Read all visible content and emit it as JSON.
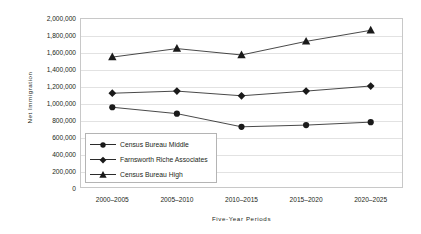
{
  "chart_data": {
    "type": "line",
    "title": "",
    "subtitle": "",
    "xlabel": "Five-Year Periods",
    "ylabel": "Net Immigration",
    "categories": [
      "2000–2005",
      "2005–2010",
      "2010–2015",
      "2015–2020",
      "2020–2025"
    ],
    "ylim": [
      0,
      2000000
    ],
    "ytick_step": 200000,
    "ytick_labels": [
      "2,000,000",
      "1,800,000",
      "1,600,000",
      "1,400,000",
      "1,200,000",
      "1,000,000",
      "800,000",
      "600,000",
      "400,000",
      "200,000",
      "0"
    ],
    "ytick_values": [
      2000000,
      1800000,
      1600000,
      1400000,
      1200000,
      1000000,
      800000,
      600000,
      400000,
      200000,
      0
    ],
    "grid": true,
    "grid_axis": "y",
    "legend_position": "inside-lower-left",
    "series": [
      {
        "name": "Census Bureau Middle",
        "marker": "circle",
        "color": "#1a1a1a",
        "values": [
          950000,
          875000,
          720000,
          740000,
          775000
        ]
      },
      {
        "name": "Farnsworth Riche Associates",
        "marker": "diamond",
        "color": "#1a1a1a",
        "values": [
          1115000,
          1140000,
          1085000,
          1140000,
          1200000
        ]
      },
      {
        "name": "Census Bureau High",
        "marker": "triangle",
        "color": "#1a1a1a",
        "values": [
          1540000,
          1640000,
          1565000,
          1725000,
          1855000
        ]
      }
    ]
  },
  "legend": {
    "items": [
      {
        "label": "Census Bureau Middle",
        "marker": "circle"
      },
      {
        "label": "Farnsworth Riche Associates",
        "marker": "diamond"
      },
      {
        "label": "Census Bureau High",
        "marker": "triangle"
      }
    ]
  },
  "colors": {
    "series": "#1a1a1a",
    "gridline": "#e2e2e2",
    "frame": "#c8c8c8",
    "text": "#231f20",
    "background": "#ffffff"
  }
}
